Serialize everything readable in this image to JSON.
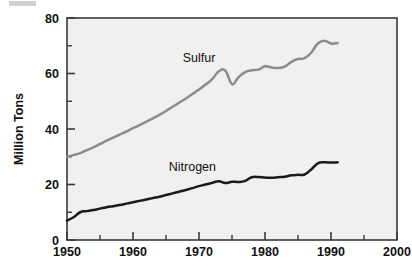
{
  "chart_data": {
    "type": "line",
    "title": "",
    "subtitle": "",
    "xlabel": "",
    "ylabel": "Million Tons",
    "xlim": [
      1950,
      2000
    ],
    "ylim": [
      0,
      80
    ],
    "x_ticks": [
      1950,
      1960,
      1970,
      1980,
      1990,
      2000
    ],
    "x_tick_labels": [
      "1950",
      "1960",
      "1970",
      "1980",
      "1990",
      "2000"
    ],
    "x_minor_ticks": [
      1955,
      1965,
      1975,
      1985,
      1995
    ],
    "y_ticks": [
      0,
      20,
      40,
      60,
      80
    ],
    "y_tick_labels": [
      "0",
      "20",
      "40",
      "60",
      "80"
    ],
    "y_minor_ticks": [
      10,
      30,
      50,
      70
    ],
    "grid": false,
    "legend_position": "inline-annotation",
    "plot_background": "#f0f0f0",
    "frame_color": "#3a3a3a",
    "series": [
      {
        "name": "Sulfur",
        "color": "#8c8c8c",
        "label_x": 1970,
        "label_y": 64,
        "x": [
          1950,
          1951,
          1952,
          1953,
          1954,
          1955,
          1956,
          1957,
          1958,
          1959,
          1960,
          1961,
          1962,
          1963,
          1964,
          1965,
          1966,
          1967,
          1968,
          1969,
          1970,
          1971,
          1972,
          1973,
          1974,
          1975,
          1976,
          1977,
          1978,
          1979,
          1980,
          1981,
          1982,
          1983,
          1984,
          1985,
          1986,
          1987,
          1988,
          1989,
          1990,
          1991
        ],
        "values": [
          30.0,
          30.6,
          31.3,
          32.4,
          33.4,
          34.6,
          35.8,
          36.9,
          38.0,
          39.1,
          40.3,
          41.4,
          42.6,
          43.8,
          45.1,
          46.5,
          48.0,
          49.5,
          51.0,
          52.6,
          54.2,
          56.0,
          58.0,
          60.8,
          61.0,
          56.2,
          58.7,
          60.5,
          61.2,
          61.4,
          62.6,
          62.2,
          62.0,
          62.5,
          64.2,
          65.2,
          65.5,
          67.5,
          70.8,
          71.8,
          70.8,
          71.0
        ]
      },
      {
        "name": "Nitrogen",
        "color": "#1a1a1a",
        "label_x": 1969,
        "label_y": 25,
        "x": [
          1950,
          1951,
          1952,
          1953,
          1954,
          1955,
          1956,
          1957,
          1958,
          1959,
          1960,
          1961,
          1962,
          1963,
          1964,
          1965,
          1966,
          1967,
          1968,
          1969,
          1970,
          1971,
          1972,
          1973,
          1974,
          1975,
          1976,
          1977,
          1978,
          1979,
          1980,
          1981,
          1982,
          1983,
          1984,
          1985,
          1986,
          1987,
          1988,
          1989,
          1990,
          1991
        ],
        "values": [
          7.0,
          8.2,
          10.0,
          10.4,
          10.8,
          11.3,
          11.8,
          12.2,
          12.6,
          13.1,
          13.6,
          14.1,
          14.6,
          15.1,
          15.6,
          16.2,
          16.8,
          17.4,
          18.0,
          18.7,
          19.4,
          20.0,
          20.6,
          21.2,
          20.5,
          21.0,
          20.9,
          21.3,
          22.6,
          22.7,
          22.5,
          22.4,
          22.6,
          22.8,
          23.3,
          23.5,
          23.6,
          25.4,
          27.6,
          28.0,
          27.9,
          28.0
        ]
      }
    ],
    "annotations": [
      {
        "text": "Sulfur",
        "x": 1970,
        "y": 64
      },
      {
        "text": "Nitrogen",
        "x": 1969,
        "y": 25
      }
    ]
  },
  "axis": {
    "y_title": "Million Tons"
  }
}
